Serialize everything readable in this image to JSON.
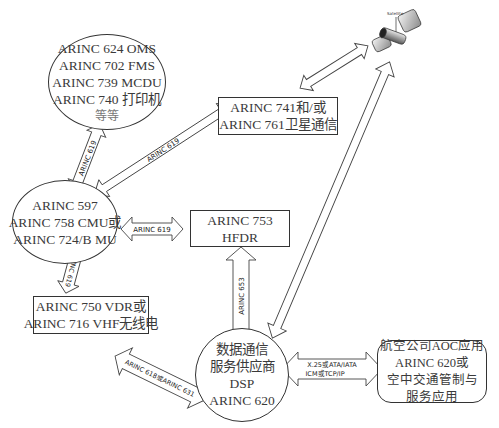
{
  "diagram": {
    "nodes": {
      "avionics": {
        "shape": "ellipse",
        "lines": [
          "ARINC 624 OMS",
          "ARINC 702 FMS",
          "ARINC 739 MCDU",
          "ARINC 740 打印机",
          "等等"
        ]
      },
      "cmu": {
        "shape": "ellipse",
        "lines": [
          "ARINC 597",
          "ARINC 758 CMU或",
          "ARINC 724/B MU"
        ]
      },
      "satcom": {
        "shape": "rect",
        "lines": [
          "ARINC 741和/或",
          "ARINC 761卫星通信"
        ]
      },
      "hfdr": {
        "shape": "rect",
        "lines": [
          "ARINC 753",
          "HFDR"
        ]
      },
      "vhf": {
        "shape": "rect",
        "lines": [
          "ARINC 750 VDR或",
          "ARINC 716 VHF无线电"
        ]
      },
      "dsp": {
        "shape": "ellipse",
        "lines": [
          "数据通信",
          "服务供应商",
          "DSP",
          "ARINC 620"
        ]
      },
      "ground_app": {
        "shape": "rounded-rect",
        "lines": [
          "航空公司AOC应用",
          "ARINC 620或",
          "空中交通管制与",
          "服务应用"
        ]
      },
      "satellite": {
        "shape": "icon",
        "label": "Satellite"
      }
    },
    "connections": [
      {
        "from": "avionics",
        "to": "cmu",
        "label": "ARINC 619"
      },
      {
        "from": "cmu",
        "to": "satcom",
        "label": "ARINC 619"
      },
      {
        "from": "cmu",
        "to": "hfdr",
        "label": "ARINC 619"
      },
      {
        "from": "cmu",
        "to": "vhf",
        "label": "ARINC 619"
      },
      {
        "from": "satcom",
        "to": "satellite",
        "label": ""
      },
      {
        "from": "satellite",
        "to": "dsp",
        "label": ""
      },
      {
        "from": "hfdr",
        "to": "dsp",
        "label": "ARINC 653"
      },
      {
        "from": "vhf",
        "to": "dsp",
        "label": "ARINC 618或ARINC 631"
      },
      {
        "from": "dsp",
        "to": "ground_app",
        "label_lines": [
          "X.25或ATA/IATA",
          "ICM或TCP/IP"
        ]
      }
    ],
    "colors": {
      "stroke": "#333333",
      "fill": "#ffffff",
      "text": "#3a3a3a"
    }
  }
}
